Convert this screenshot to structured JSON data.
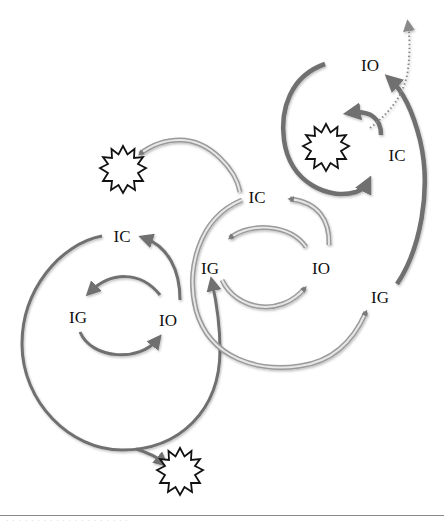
{
  "diagram": {
    "type": "cyclic-process",
    "colors": {
      "solid_arrow": "#6f6f6f",
      "double_arrow_outer": "#9a9a9a",
      "double_arrow_inner": "#e6e6e6",
      "dotted_arrow": "#8a8a8a",
      "starburst_stroke": "#111111",
      "label": "#111111",
      "separator": "#8a8a8a"
    },
    "nodes": [
      {
        "id": "left-ic",
        "label": "IC",
        "x": 122,
        "y": 236
      },
      {
        "id": "left-ig",
        "label": "IG",
        "x": 78,
        "y": 317
      },
      {
        "id": "left-io",
        "label": "IO",
        "x": 168,
        "y": 320
      },
      {
        "id": "mid-ic",
        "label": "IC",
        "x": 257,
        "y": 197
      },
      {
        "id": "mid-ig",
        "label": "IG",
        "x": 210,
        "y": 268
      },
      {
        "id": "mid-io",
        "label": "IO",
        "x": 321,
        "y": 268
      },
      {
        "id": "right-ig",
        "label": "IG",
        "x": 380,
        "y": 297
      },
      {
        "id": "top-io",
        "label": "IO",
        "x": 370,
        "y": 65
      },
      {
        "id": "top-ic",
        "label": "IC",
        "x": 397,
        "y": 155
      }
    ],
    "starbursts": [
      {
        "id": "starburst-top-left",
        "x": 123,
        "y": 170
      },
      {
        "id": "starburst-top-right",
        "x": 326,
        "y": 148
      },
      {
        "id": "starburst-bottom",
        "x": 180,
        "y": 472
      }
    ],
    "caption": "· · · · · · · · · · · · · · · · · · · ·"
  }
}
